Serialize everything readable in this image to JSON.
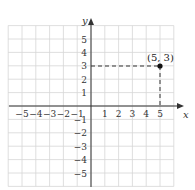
{
  "chart_data": {
    "type": "scatter",
    "title": "",
    "xlabel": "x",
    "ylabel": "y",
    "xlim": [
      -6,
      6
    ],
    "ylim": [
      -6,
      6
    ],
    "grid": true,
    "x_ticks": [
      "−5",
      "−4",
      "−3",
      "−2",
      "−1",
      "1",
      "2",
      "3",
      "4",
      "5"
    ],
    "y_ticks": [
      "5",
      "4",
      "3",
      "2",
      "1",
      "−1",
      "−2",
      "−3",
      "−4",
      "−5"
    ],
    "points": [
      {
        "x": 5,
        "y": 3,
        "label": "(5, 3)"
      }
    ],
    "annotations": [
      "dashed projection from (5, 3) to x-axis and y-axis"
    ]
  },
  "labels": {
    "x_axis": "x",
    "y_axis": "y",
    "point": "(5, 3)"
  },
  "colors": {
    "grid": "#d6d6d6",
    "axis": "#333333",
    "point": "#111111"
  }
}
